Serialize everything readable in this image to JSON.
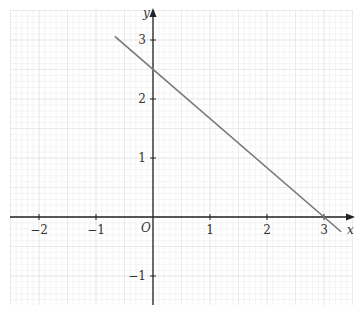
{
  "chart_data": {
    "type": "line",
    "title": "",
    "xlabel": "x",
    "ylabel": "y",
    "origin_label": "O",
    "xlim": [
      -2.5,
      3.5
    ],
    "ylim": [
      -1.5,
      3.3
    ],
    "grid": true,
    "x_ticks": [
      -2,
      -1,
      1,
      2,
      3
    ],
    "x_tick_labels": [
      "−2",
      "−1",
      "1",
      "2",
      "3"
    ],
    "y_ticks": [
      -1,
      1,
      2,
      3
    ],
    "y_tick_labels": [
      "−1",
      "1",
      "2",
      "3"
    ],
    "series": [
      {
        "name": "line",
        "equation": "y = 2.5 - (5/6)x",
        "x": [
          -0.67,
          3.3
        ],
        "y": [
          3.06,
          -0.25
        ],
        "y_intercept": 2.5,
        "x_intercept": 3
      }
    ]
  },
  "style": {
    "line_color": "#777777",
    "axis_color": "#222222",
    "grid_major": "#d4d4d4",
    "grid_minor": "#ececec"
  }
}
